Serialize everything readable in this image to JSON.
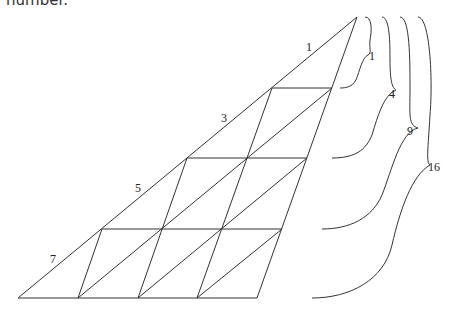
{
  "caption_fragment": "number.",
  "diagram": {
    "type": "triangular-grid-odd-sums",
    "side_labels": [
      "1",
      "3",
      "5",
      "7"
    ],
    "brace_labels": [
      "1",
      "4",
      "9",
      "16"
    ],
    "rows": 4,
    "line_color": "#333333"
  }
}
